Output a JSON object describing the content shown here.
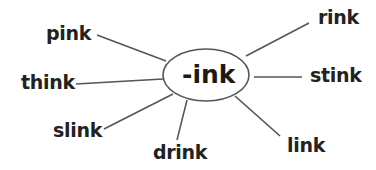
{
  "center": {
    "label": "-ink"
  },
  "words": [
    {
      "id": "pink",
      "label": "pink"
    },
    {
      "id": "think",
      "label": "think"
    },
    {
      "id": "slink",
      "label": "slink"
    },
    {
      "id": "drink",
      "label": "drink"
    },
    {
      "id": "link",
      "label": "link"
    },
    {
      "id": "stink",
      "label": "stink"
    },
    {
      "id": "rink",
      "label": "rink"
    }
  ],
  "colors": {
    "line": "#555555",
    "text": "#222222"
  }
}
